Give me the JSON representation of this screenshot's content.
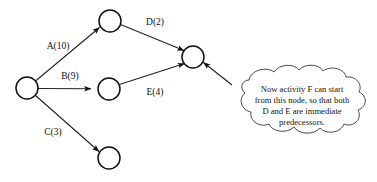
{
  "diagram": {
    "background_color": "#ffffff",
    "stroke_color": "#111111",
    "nodes": [
      {
        "id": "start",
        "name": "start-node",
        "cx": 27,
        "cy": 88,
        "r": 11
      },
      {
        "id": "n_top",
        "name": "top-node",
        "cx": 110,
        "cy": 21,
        "r": 11
      },
      {
        "id": "n_mid",
        "name": "middle-node",
        "cx": 109,
        "cy": 89,
        "r": 11
      },
      {
        "id": "n_bottom",
        "name": "bottom-node",
        "cx": 109,
        "cy": 158,
        "r": 11
      },
      {
        "id": "merge",
        "name": "merge-node",
        "cx": 193,
        "cy": 57,
        "r": 11
      }
    ],
    "edges": [
      {
        "id": "A",
        "label": "A(10)",
        "from": "start",
        "to": "n_top",
        "label_x": 58,
        "label_y": 47
      },
      {
        "id": "B",
        "label": "B(9)",
        "from": "start",
        "to": "n_mid",
        "label_x": 70,
        "label_y": 77
      },
      {
        "id": "C",
        "label": "C(3)",
        "from": "start",
        "to": "n_bottom",
        "label_x": 53,
        "label_y": 133
      },
      {
        "id": "D",
        "label": "D(2)",
        "from": "n_top",
        "to": "merge",
        "label_x": 155,
        "label_y": 23
      },
      {
        "id": "E",
        "label": "E(4)",
        "from": "n_mid",
        "to": "merge",
        "label_x": 155,
        "label_y": 93
      }
    ],
    "callout": {
      "name": "cloud-callout",
      "shape": "thought-cloud",
      "points_to": "merge",
      "lines": [
        "Now activity F can start",
        "from this node, so that both",
        "D and E are immediate",
        "predecessors."
      ],
      "full_text": "Now activity F can start from this node, so that both D and E are immediate predecessors."
    }
  }
}
